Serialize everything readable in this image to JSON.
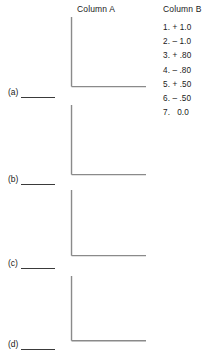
{
  "page": {
    "type": "correlation-matching-worksheet",
    "instruction_implied": "Match each scatterplot in Column A with a correlation coefficient from Column B"
  },
  "headers": {
    "column_a": "Column A",
    "column_b": "Column B"
  },
  "column_b": {
    "items": [
      {
        "number": "1.",
        "value": "+ 1.0"
      },
      {
        "number": "2.",
        "value": "– 1.0"
      },
      {
        "number": "3.",
        "value": "+ .80"
      },
      {
        "number": "4.",
        "value": "– .80"
      },
      {
        "number": "5.",
        "value": "+ .50"
      },
      {
        "number": "6.",
        "value": "– .50"
      },
      {
        "number": "7.",
        "value": "  0.0"
      }
    ]
  },
  "answers": [
    {
      "label": "(a)",
      "value": ""
    },
    {
      "label": "(b)",
      "value": ""
    },
    {
      "label": "(c)",
      "value": ""
    },
    {
      "label": "(d)",
      "value": ""
    }
  ],
  "colors": {
    "axis": "#8a8a8a",
    "dot": "#111111",
    "line": "#8a8a8a",
    "text": "#1a1a1a"
  },
  "chart_data": [
    {
      "id": "plot-a",
      "type": "scatter",
      "title": "",
      "xlabel": "",
      "ylabel": "",
      "xlim": [
        0,
        100
      ],
      "ylim": [
        0,
        100
      ],
      "grid": false,
      "legend": null,
      "description": "Dense elongated band of filled dots sloping from upper-left to lower-right; strong negative correlation",
      "implied_correlation": "-.80",
      "points": [
        [
          8,
          95
        ],
        [
          14,
          93
        ],
        [
          20,
          91
        ],
        [
          26,
          88
        ],
        [
          6,
          87
        ],
        [
          12,
          85
        ],
        [
          18,
          83
        ],
        [
          24,
          81
        ],
        [
          30,
          79
        ],
        [
          10,
          78
        ],
        [
          16,
          76
        ],
        [
          22,
          74
        ],
        [
          28,
          72
        ],
        [
          34,
          70
        ],
        [
          40,
          68
        ],
        [
          20,
          66
        ],
        [
          26,
          64
        ],
        [
          32,
          62
        ],
        [
          38,
          60
        ],
        [
          44,
          58
        ],
        [
          30,
          55
        ],
        [
          36,
          53
        ],
        [
          42,
          51
        ],
        [
          48,
          49
        ],
        [
          54,
          47
        ],
        [
          40,
          44
        ],
        [
          46,
          42
        ],
        [
          52,
          40
        ],
        [
          58,
          38
        ],
        [
          64,
          36
        ],
        [
          50,
          33
        ],
        [
          56,
          31
        ],
        [
          62,
          29
        ],
        [
          68,
          27
        ],
        [
          74,
          25
        ],
        [
          60,
          22
        ],
        [
          66,
          20
        ],
        [
          72,
          18
        ],
        [
          78,
          16
        ],
        [
          84,
          14
        ],
        [
          70,
          12
        ],
        [
          76,
          10
        ],
        [
          82,
          9
        ],
        [
          88,
          12
        ]
      ]
    },
    {
      "id": "plot-b",
      "type": "scatter",
      "title": "",
      "xlabel": "",
      "ylabel": "",
      "xlim": [
        0,
        100
      ],
      "ylim": [
        0,
        100
      ],
      "grid": false,
      "legend": null,
      "description": "Roughly circular cloud of filled dots with no directional trend; zero correlation",
      "implied_correlation": "0.0",
      "points": [
        [
          38,
          92
        ],
        [
          52,
          90
        ],
        [
          66,
          88
        ],
        [
          30,
          82
        ],
        [
          44,
          84
        ],
        [
          58,
          80
        ],
        [
          72,
          82
        ],
        [
          24,
          74
        ],
        [
          38,
          76
        ],
        [
          52,
          72
        ],
        [
          66,
          74
        ],
        [
          78,
          70
        ],
        [
          20,
          64
        ],
        [
          34,
          66
        ],
        [
          48,
          62
        ],
        [
          62,
          64
        ],
        [
          76,
          60
        ],
        [
          84,
          64
        ],
        [
          22,
          54
        ],
        [
          36,
          56
        ],
        [
          50,
          52
        ],
        [
          64,
          54
        ],
        [
          78,
          50
        ],
        [
          26,
          44
        ],
        [
          40,
          46
        ],
        [
          54,
          42
        ],
        [
          68,
          44
        ],
        [
          80,
          42
        ],
        [
          32,
          34
        ],
        [
          46,
          36
        ],
        [
          60,
          32
        ],
        [
          74,
          34
        ],
        [
          40,
          24
        ],
        [
          54,
          22
        ],
        [
          66,
          26
        ],
        [
          48,
          14
        ]
      ]
    },
    {
      "id": "plot-c",
      "type": "line",
      "title": "",
      "xlabel": "",
      "ylabel": "",
      "xlim": [
        0,
        100
      ],
      "ylim": [
        0,
        100
      ],
      "grid": false,
      "legend": null,
      "description": "Perfect straight line rising from the origin to the upper right; perfect positive correlation",
      "implied_correlation": "+1.0",
      "x": [
        0,
        100
      ],
      "values": [
        0,
        100
      ]
    },
    {
      "id": "plot-d",
      "type": "line",
      "title": "",
      "xlabel": "",
      "ylabel": "",
      "xlim": [
        0,
        100
      ],
      "ylim": [
        0,
        100
      ],
      "grid": false,
      "legend": null,
      "description": "Perfect straight line falling from the upper left to the lower right; perfect negative correlation",
      "implied_correlation": "-1.0",
      "x": [
        0,
        100
      ],
      "values": [
        100,
        0
      ]
    }
  ]
}
